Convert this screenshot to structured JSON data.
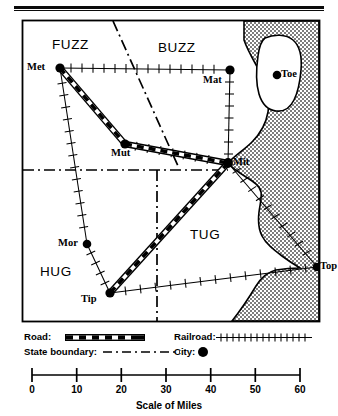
{
  "figure": {
    "type": "thematic-map",
    "scale_caption": "Scale of Miles"
  },
  "map": {
    "frame": {
      "x": 22,
      "y": 20,
      "width": 298,
      "height": 302
    },
    "ocean_fill": "#9a9a9a",
    "land_fill": "#ffffff",
    "ink": "#000000",
    "states": [
      {
        "name": "FUZZ",
        "x": 52,
        "y": 38
      },
      {
        "name": "BUZZ",
        "x": 158,
        "y": 41
      },
      {
        "name": "HUG",
        "x": 40,
        "y": 265
      },
      {
        "name": "TUG",
        "x": 190,
        "y": 228
      }
    ],
    "cities": [
      {
        "name": "Met",
        "cx": 60,
        "cy": 68,
        "label_x": 27,
        "label_y": 62
      },
      {
        "name": "Mat",
        "cx": 230,
        "cy": 70,
        "label_x": 203,
        "label_y": 75
      },
      {
        "name": "Toe",
        "cx": 277,
        "cy": 75,
        "label_x": 281,
        "label_y": 69
      },
      {
        "name": "Mut",
        "cx": 125,
        "cy": 144,
        "label_x": 111,
        "label_y": 148
      },
      {
        "name": "Mit",
        "cx": 228,
        "cy": 163,
        "label_x": 233,
        "label_y": 157
      },
      {
        "name": "Mor",
        "cx": 87,
        "cy": 244,
        "label_x": 58,
        "label_y": 238
      },
      {
        "name": "Tip",
        "cx": 110,
        "cy": 293,
        "label_x": 81,
        "label_y": 294
      },
      {
        "name": "Top",
        "cx": 317,
        "cy": 267,
        "label_x": 320,
        "label_y": 261
      }
    ],
    "roads": [
      {
        "from": "Met",
        "to": "Mut"
      },
      {
        "from": "Mut",
        "to": "Mit"
      },
      {
        "from": "Mit",
        "to": "Tip"
      }
    ],
    "railroads": [
      {
        "from": "Met",
        "to": "Mat"
      },
      {
        "from": "Mat",
        "to": "Mit"
      },
      {
        "from": "Mut",
        "to": "Mit"
      },
      {
        "from": "Met",
        "to": "Mor"
      },
      {
        "from": "Mor",
        "to": "Tip"
      },
      {
        "from": "Mit",
        "to": "Top"
      },
      {
        "from": "Tip",
        "to": "Top"
      }
    ],
    "state_boundaries": [
      {
        "kind": "diagonal",
        "from": [
          113,
          21
        ],
        "to": [
          178,
          166
        ]
      },
      {
        "kind": "horizontal",
        "from": [
          22,
          170
        ],
        "to": [
          228,
          170
        ]
      },
      {
        "kind": "vertical",
        "from": [
          157,
          170
        ],
        "to": [
          157,
          322
        ]
      }
    ]
  },
  "legend": {
    "items": [
      {
        "key": "road",
        "label": "Road:",
        "symbol": "dash-road"
      },
      {
        "key": "state_boundary",
        "label": "State boundary:",
        "symbol": "dash-dot"
      },
      {
        "key": "railroad",
        "label": "Railroad:",
        "symbol": "tick-line"
      },
      {
        "key": "city",
        "label": "City:",
        "symbol": "filled-circle"
      }
    ]
  },
  "scale": {
    "caption": "Scale of Miles",
    "ticks": [
      "0",
      "10",
      "20",
      "30",
      "40",
      "50",
      "60"
    ],
    "min": 0,
    "max": 60,
    "unit": "miles"
  }
}
